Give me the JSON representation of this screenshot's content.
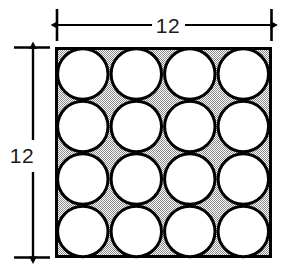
{
  "figure": {
    "square": {
      "side_label_top": "12",
      "side_label_left": "12",
      "units": "",
      "border_color": "#000000",
      "border_width_px": 3,
      "fill_style": "stippled-gray-50",
      "fill_color": "#b4b4b4",
      "x": 55,
      "y": 47,
      "width": 217,
      "height": 211
    },
    "circles": {
      "rows": 4,
      "columns": 4,
      "count": 16,
      "fill_color": "#ffffff",
      "stroke_color": "#000000",
      "stroke_width_px": 3,
      "diameter_units": 3,
      "radius_units": 1.5
    },
    "dimensions": [
      {
        "name": "top-width",
        "label": "12",
        "orientation": "horizontal",
        "arrow_style": "double-headed",
        "from_px": 57,
        "to_px": 272,
        "axis_px": 25
      },
      {
        "name": "left-height",
        "label": "12",
        "orientation": "vertical",
        "arrow_style": "double-headed",
        "from_px": 47,
        "to_px": 258,
        "axis_px": 33
      }
    ],
    "colors": {
      "ink": "#000000",
      "label_ink": "#1a1a1a",
      "page_background": "#ffffff",
      "shade": "#b4b4b4"
    }
  }
}
